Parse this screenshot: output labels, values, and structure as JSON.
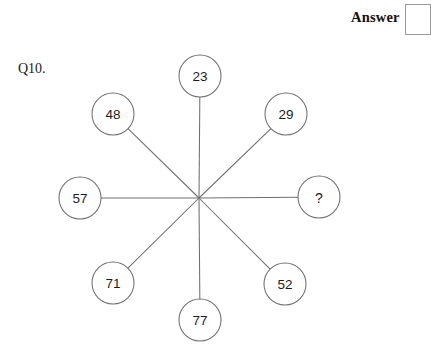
{
  "page": {
    "background_color": "#ffffff",
    "width": 420,
    "height": 362
  },
  "header": {
    "answer_label": "Answer",
    "answer_box_value": ""
  },
  "question": {
    "number_label": "Q10."
  },
  "puzzle": {
    "type": "radial-spoke-number-wheel",
    "hub": {
      "x": 199,
      "y": 198
    },
    "circle_radius": 21,
    "stroke_color": "#6f6f72",
    "nodes": [
      {
        "id": "node-top",
        "value": "23",
        "cx": 200,
        "cy": 76,
        "unknown": false
      },
      {
        "id": "node-top-right",
        "value": "29",
        "cx": 286,
        "cy": 114,
        "unknown": false
      },
      {
        "id": "node-right",
        "value": "?",
        "cx": 319,
        "cy": 197,
        "unknown": true
      },
      {
        "id": "node-bottom-right",
        "value": "52",
        "cx": 285,
        "cy": 284,
        "unknown": false
      },
      {
        "id": "node-bottom",
        "value": "77",
        "cx": 200,
        "cy": 320,
        "unknown": false
      },
      {
        "id": "node-bottom-left",
        "value": "71",
        "cx": 113,
        "cy": 283,
        "unknown": false
      },
      {
        "id": "node-left",
        "value": "57",
        "cx": 80,
        "cy": 198,
        "unknown": false
      },
      {
        "id": "node-top-left",
        "value": "48",
        "cx": 113,
        "cy": 114,
        "unknown": false
      }
    ]
  }
}
